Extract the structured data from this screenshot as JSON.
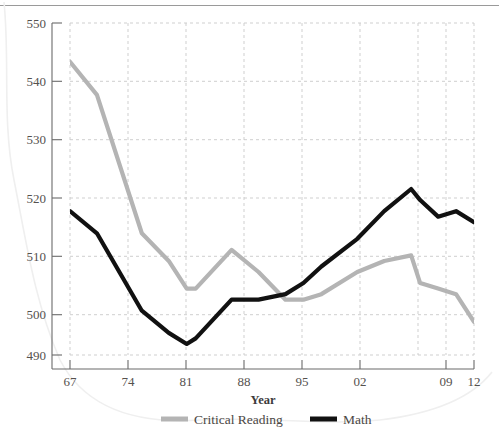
{
  "chart_data": {
    "type": "line",
    "title": "",
    "xlabel": "Year",
    "ylabel": "",
    "xlim": [
      1967,
      2012
    ],
    "ylim": [
      490,
      550
    ],
    "grid": true,
    "legend_position": "bottom",
    "xticks": [
      "67",
      "74",
      "81",
      "88",
      "95",
      "02",
      "09",
      "12"
    ],
    "xtick_values": [
      1967,
      1974,
      1981,
      1988,
      1995,
      2002,
      2009,
      2012
    ],
    "yticks": [
      "490",
      "500",
      "510",
      "520",
      "530",
      "540",
      "550"
    ],
    "ytick_values": [
      490,
      500,
      510,
      520,
      530,
      540,
      550
    ],
    "x": [
      1967,
      1970,
      1975,
      1978,
      1980,
      1981,
      1985,
      1988,
      1991,
      1993,
      1995,
      1999,
      2002,
      2005,
      2006,
      2008,
      2010,
      2012
    ],
    "series": [
      {
        "name": "Critical Reading",
        "color": "#b4b4b4",
        "values": [
          543,
          537,
          512,
          507,
          502,
          502,
          509,
          505,
          500,
          500,
          501,
          505,
          507,
          508,
          503,
          502,
          501,
          496
        ]
      },
      {
        "name": "Math",
        "color": "#111111",
        "values": [
          516,
          512,
          498,
          494,
          492,
          493,
          500,
          500,
          501,
          503,
          506,
          511,
          516,
          520,
          518,
          515,
          516,
          514
        ]
      }
    ]
  },
  "axes": {
    "x_title": "Year"
  },
  "legend": {
    "items": [
      {
        "label": "Critical Reading",
        "color": "#b4b4b4"
      },
      {
        "label": "Math",
        "color": "#111111"
      }
    ]
  }
}
